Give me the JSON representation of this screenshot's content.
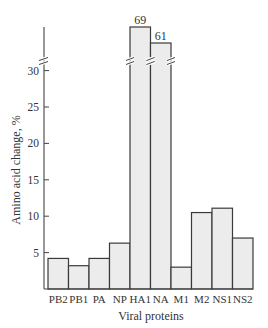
{
  "chart_data": {
    "type": "bar",
    "title": "",
    "xlabel": "Viral proteins",
    "ylabel": "Amino acid change, %",
    "categories": [
      "PB2",
      "PB1",
      "PA",
      "NP",
      "HA1",
      "NA",
      "M1",
      "M2",
      "NS1",
      "NS2"
    ],
    "values": [
      4.2,
      3.2,
      4.2,
      6.3,
      69,
      61,
      3.0,
      10.5,
      11.1,
      7.0
    ],
    "value_labels": {
      "HA1": "69",
      "NA": "61"
    },
    "ylim": [
      0,
      35
    ],
    "yticks": [
      5,
      10,
      15,
      20,
      25,
      30
    ],
    "axis_break": {
      "above": 30,
      "note": "y-axis broken above 30; HA1 and NA bars truncated"
    },
    "grid": false,
    "legend": null
  },
  "labels": {
    "xlabel": "Viral proteins",
    "ylabel": "Amino acid change, %",
    "ha1_value": "69",
    "na_value": "61"
  }
}
